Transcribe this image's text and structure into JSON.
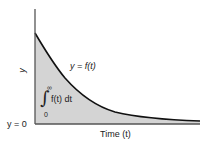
{
  "diagram": {
    "type": "area-under-curve",
    "y_axis_label": "y",
    "x_axis_label": "Time (t)",
    "curve_label": "y = f(t)",
    "baseline_label": "y = 0",
    "integral": {
      "upper_limit": "∞",
      "lower_limit": "0",
      "integrand": "f(t) dt"
    },
    "colors": {
      "fill": "#d4d4d4",
      "curve": "#111111",
      "axis": "#555555"
    },
    "curve_points": [
      [
        35,
        33
      ],
      [
        45,
        50
      ],
      [
        60,
        72
      ],
      [
        80,
        95
      ],
      [
        100,
        108
      ],
      [
        130,
        115
      ],
      [
        160,
        119
      ],
      [
        200,
        121
      ]
    ]
  }
}
